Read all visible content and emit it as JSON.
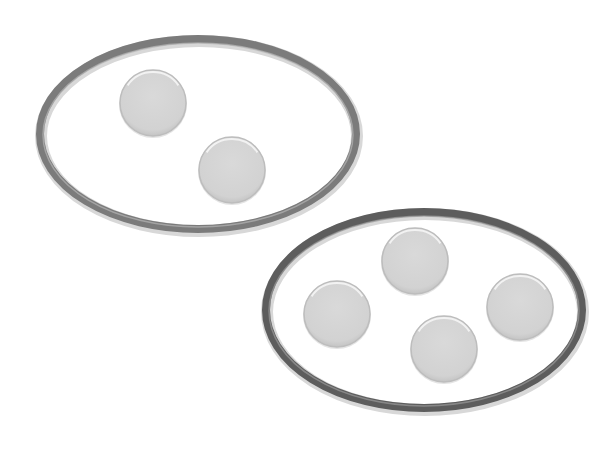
{
  "diagram": {
    "type": "grouping",
    "colors": {
      "background": "#ffffff",
      "disc_fill": "#d4d4d4",
      "disc_edge": "#bdbdbd",
      "disc_highlight": "#f2f2f2",
      "group_a_stroke": "#7b7b7b",
      "group_a_stroke_light": "#b5b5b5",
      "group_b_stroke": "#5d5d5d",
      "group_b_stroke_light": "#9a9a9a"
    },
    "groups": [
      {
        "id": "group-a",
        "count": 2,
        "ellipse": {
          "cx": 198,
          "cy": 134,
          "rx": 158,
          "ry": 95,
          "stroke_width": 8
        },
        "items": [
          {
            "cx": 153,
            "cy": 103,
            "r": 33
          },
          {
            "cx": 232,
            "cy": 170,
            "r": 33
          }
        ]
      },
      {
        "id": "group-b",
        "count": 4,
        "ellipse": {
          "cx": 424,
          "cy": 310,
          "rx": 158,
          "ry": 98,
          "stroke_width": 8
        },
        "items": [
          {
            "cx": 415,
            "cy": 261,
            "r": 33
          },
          {
            "cx": 337,
            "cy": 314,
            "r": 33
          },
          {
            "cx": 444,
            "cy": 349,
            "r": 33
          },
          {
            "cx": 520,
            "cy": 307,
            "r": 33
          }
        ]
      }
    ]
  }
}
